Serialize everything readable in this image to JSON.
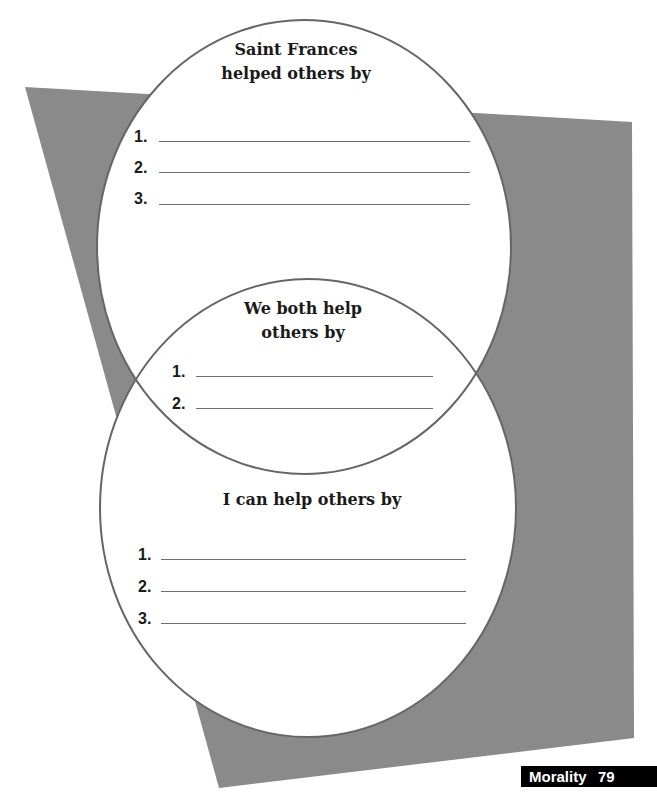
{
  "colors": {
    "background_shape": "#8a8a8a",
    "circle_stroke": "#666666",
    "circle_fill": "#ffffff",
    "footer_bg": "#000000",
    "footer_text": "#ffffff"
  },
  "venn": {
    "top_circle": {
      "title_line1": "Saint Frances",
      "title_line2": "helped others by",
      "items": [
        {
          "number": "1.",
          "value": ""
        },
        {
          "number": "2.",
          "value": ""
        },
        {
          "number": "3.",
          "value": ""
        }
      ]
    },
    "overlap": {
      "title_line1": "We both help",
      "title_line2": "others by",
      "items": [
        {
          "number": "1.",
          "value": ""
        },
        {
          "number": "2.",
          "value": ""
        }
      ]
    },
    "bottom_circle": {
      "title": "I can help others by",
      "items": [
        {
          "number": "1.",
          "value": ""
        },
        {
          "number": "2.",
          "value": ""
        },
        {
          "number": "3.",
          "value": ""
        }
      ]
    }
  },
  "footer": {
    "section": "Morality",
    "page_number": "79"
  }
}
